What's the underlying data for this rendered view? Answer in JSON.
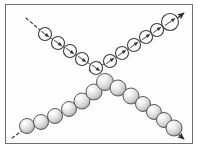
{
  "figure": {
    "title": "Crossing particle chains diagram",
    "frame": {
      "border_color": "#6d6d6d",
      "background_color": "#fefefe",
      "border_width": 1,
      "x": 5,
      "y": 4,
      "width": 188,
      "height": 140
    },
    "chart_data": {
      "type": "scatter",
      "title": "Crossing particle chains diagram",
      "xlabel": "",
      "ylabel": "",
      "xlim": [
        0,
        198
      ],
      "ylim": [
        0,
        149
      ],
      "grid": false,
      "legend": "none",
      "annotations": [
        {
          "name": "upper-left-dashed-line",
          "kind": "dashed-line",
          "x1": 26,
          "y1": 18,
          "x2": 40,
          "y2": 30,
          "color": "#3a3a3a"
        },
        {
          "name": "lower-left-dashed-line",
          "kind": "dashed-line",
          "x1": 12,
          "y1": 138,
          "x2": 26,
          "y2": 128,
          "color": "#3a3a3a"
        },
        {
          "name": "upper-right-arrow",
          "kind": "arrow",
          "x1": 171,
          "y1": 23,
          "x2": 184,
          "y2": 13,
          "color": "#2b2b2b"
        },
        {
          "name": "lower-right-arrow",
          "kind": "arrow",
          "x1": 171,
          "y1": 128,
          "x2": 184,
          "y2": 139,
          "color": "#2b2b2b"
        },
        {
          "name": "center-cross-tick",
          "kind": "cross-tick",
          "x": 96,
          "y": 66,
          "color": "#2b2b2b"
        }
      ],
      "series": [
        {
          "name": "hollow-spin-chain",
          "marker": "open-circle-with-internal-arrow",
          "stroke_color": "#3b3b3b",
          "fill_color": "#ffffff",
          "description": "Open circles each containing a short diagonal spin arrow; forms a V shape descending from upper-left to the centre then ascending to upper-right.",
          "points": [
            {
              "x": 45,
              "y": 34,
              "r": 6.5,
              "arrow_angle": -35
            },
            {
              "x": 58,
              "y": 43,
              "r": 6.5,
              "arrow_angle": -35
            },
            {
              "x": 70,
              "y": 51,
              "r": 6.5,
              "arrow_angle": -35
            },
            {
              "x": 82,
              "y": 59,
              "r": 6.5,
              "arrow_angle": -35
            },
            {
              "x": 96,
              "y": 68,
              "r": 6.5,
              "arrow_angle": -35
            },
            {
              "x": 110,
              "y": 61,
              "r": 6.5,
              "arrow_angle": 35
            },
            {
              "x": 122,
              "y": 53,
              "r": 6.5,
              "arrow_angle": 35
            },
            {
              "x": 134,
              "y": 45,
              "r": 6.5,
              "arrow_angle": 35
            },
            {
              "x": 146,
              "y": 37,
              "r": 6.5,
              "arrow_angle": 35
            },
            {
              "x": 157,
              "y": 30,
              "r": 6.5,
              "arrow_angle": 35
            },
            {
              "x": 170,
              "y": 22,
              "r": 8.5,
              "arrow_angle": 35
            }
          ]
        },
        {
          "name": "shaded-sphere-chain",
          "marker": "shaded-sphere",
          "stroke_color": "#4a4a4a",
          "fill_color": "#cfcfcf",
          "highlight_color": "#f7f7f7",
          "description": "Three-dimensional shaded grey spheres forming an inverted V with the apex just below the centre, descending to the lower-left and to the lower-right.",
          "points": [
            {
              "x": 27,
              "y": 126,
              "r": 7.5
            },
            {
              "x": 41,
              "y": 122,
              "r": 7.5
            },
            {
              "x": 55,
              "y": 116,
              "r": 7.5
            },
            {
              "x": 69,
              "y": 109,
              "r": 7.5
            },
            {
              "x": 82,
              "y": 101,
              "r": 8.0
            },
            {
              "x": 94,
              "y": 92,
              "r": 8.0
            },
            {
              "x": 105,
              "y": 82,
              "r": 8.5
            },
            {
              "x": 118,
              "y": 88,
              "r": 8.0
            },
            {
              "x": 131,
              "y": 96,
              "r": 8.0
            },
            {
              "x": 143,
              "y": 104,
              "r": 7.5
            },
            {
              "x": 154,
              "y": 112,
              "r": 7.5
            },
            {
              "x": 164,
              "y": 120,
              "r": 7.5
            },
            {
              "x": 174,
              "y": 128,
              "r": 8.0
            }
          ]
        }
      ]
    }
  }
}
